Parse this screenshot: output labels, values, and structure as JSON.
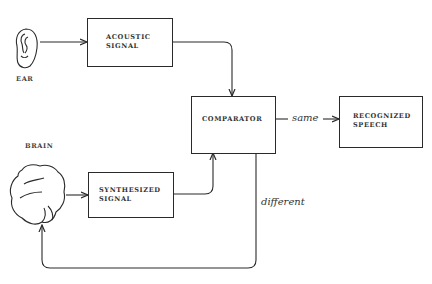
{
  "diagram": {
    "title": "",
    "nodes": {
      "ear": {
        "label": "EAR",
        "icon": "ear-icon"
      },
      "brain": {
        "label": "BRAIN",
        "icon": "brain-icon"
      },
      "acoustic_signal": {
        "line1": "ACOUSTIC",
        "line2": "SIGNAL"
      },
      "synthesized_signal": {
        "line1": "SYNTHESIZED",
        "line2": "SIGNAL"
      },
      "comparator": {
        "label": "COMPARATOR"
      },
      "recognized_speech": {
        "line1": "RECOGNIZED",
        "line2": "SPEECH"
      }
    },
    "edges": [
      {
        "from": "ear",
        "to": "acoustic_signal",
        "label": ""
      },
      {
        "from": "acoustic_signal",
        "to": "comparator",
        "label": ""
      },
      {
        "from": "brain",
        "to": "synthesized_signal",
        "label": ""
      },
      {
        "from": "synthesized_signal",
        "to": "comparator",
        "label": ""
      },
      {
        "from": "comparator",
        "to": "recognized_speech",
        "label": "same"
      },
      {
        "from": "comparator",
        "to": "brain",
        "label": "different"
      }
    ],
    "edge_labels": {
      "same": "same",
      "different": "different"
    },
    "colors": {
      "ink": "#2a2a2a",
      "background": "#ffffff"
    }
  }
}
